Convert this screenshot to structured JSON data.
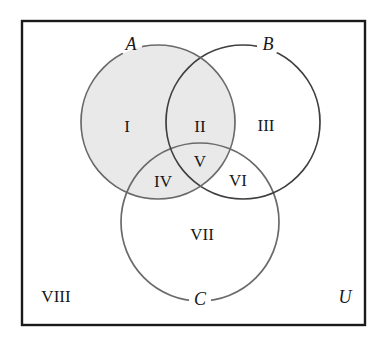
{
  "diagram": {
    "universe": {
      "label": "U",
      "outside_region_label": "VIII"
    },
    "colors": {
      "shade": "#e9e9e9",
      "outline": "#555555",
      "border": "#1a1a1a",
      "text": "#181818",
      "background": "#ffffff"
    },
    "sets": [
      {
        "name": "A",
        "label": "A",
        "cx": 158,
        "cy": 122,
        "r": 77,
        "shaded": true
      },
      {
        "name": "B",
        "label": "B",
        "cx": 243,
        "cy": 122,
        "r": 77,
        "shaded": false
      },
      {
        "name": "C",
        "label": "C",
        "cx": 200,
        "cy": 222,
        "r": 79,
        "shaded": false
      }
    ],
    "regions": [
      {
        "id": "I",
        "label": "I",
        "x": 127,
        "y": 128,
        "membership": "A only",
        "shaded": true
      },
      {
        "id": "II",
        "label": "II",
        "x": 200,
        "y": 128,
        "membership": "A and B",
        "shaded": true
      },
      {
        "id": "III",
        "label": "III",
        "x": 266,
        "y": 127,
        "membership": "B only",
        "shaded": false
      },
      {
        "id": "IV",
        "label": "IV",
        "x": 163,
        "y": 183,
        "membership": "A and C",
        "shaded": true
      },
      {
        "id": "V",
        "label": "V",
        "x": 200,
        "y": 163,
        "membership": "A and B and C",
        "shaded": true
      },
      {
        "id": "VI",
        "label": "VI",
        "x": 238,
        "y": 182,
        "membership": "B and C",
        "shaded": false
      },
      {
        "id": "VII",
        "label": "VII",
        "x": 202,
        "y": 236,
        "membership": "C only",
        "shaded": false
      },
      {
        "id": "VIII",
        "label": "VIII",
        "x": 56,
        "y": 298,
        "membership": "outside all",
        "shaded": false
      }
    ],
    "set_label_positions": [
      {
        "name": "A",
        "x": 131,
        "y": 46
      },
      {
        "name": "B",
        "x": 268,
        "y": 46
      },
      {
        "name": "C",
        "x": 200,
        "y": 301
      }
    ],
    "universe_label_position": {
      "x": 345,
      "y": 299
    },
    "frame": {
      "x": 22,
      "y": 21,
      "width": 343,
      "height": 304
    }
  }
}
